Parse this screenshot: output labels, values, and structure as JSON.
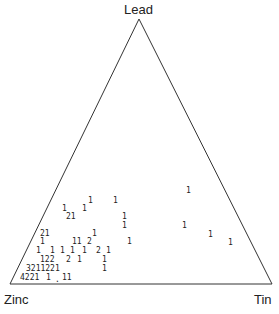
{
  "vertices": {
    "top": "Lead",
    "left": "Zinc",
    "right": "Tin"
  },
  "chart_data": {
    "type": "ternary-count-plot",
    "title": "",
    "axes": [
      "Lead",
      "Zinc",
      "Tin"
    ],
    "points": [
      {
        "x": 186,
        "y": 193,
        "text": "1"
      },
      {
        "x": 88,
        "y": 203,
        "text": "1"
      },
      {
        "x": 113,
        "y": 203,
        "text": "1"
      },
      {
        "x": 62,
        "y": 211,
        "text": "1"
      },
      {
        "x": 82,
        "y": 211,
        "text": "1"
      },
      {
        "x": 66,
        "y": 219,
        "text": "21"
      },
      {
        "x": 122,
        "y": 219,
        "text": "1"
      },
      {
        "x": 122,
        "y": 228,
        "text": "1"
      },
      {
        "x": 182,
        "y": 228,
        "text": "1"
      },
      {
        "x": 208,
        "y": 237,
        "text": "1"
      },
      {
        "x": 40,
        "y": 236,
        "text": "21"
      },
      {
        "x": 92,
        "y": 236,
        "text": "1"
      },
      {
        "x": 40,
        "y": 244,
        "text": "1"
      },
      {
        "x": 72,
        "y": 244,
        "text": "11"
      },
      {
        "x": 87,
        "y": 244,
        "text": "2"
      },
      {
        "x": 127,
        "y": 244,
        "text": "1"
      },
      {
        "x": 228,
        "y": 245,
        "text": "1"
      },
      {
        "x": 36,
        "y": 253,
        "text": "1"
      },
      {
        "x": 50,
        "y": 253,
        "text": "1"
      },
      {
        "x": 60,
        "y": 253,
        "text": "1"
      },
      {
        "x": 70,
        "y": 253,
        "text": "1"
      },
      {
        "x": 82,
        "y": 253,
        "text": "1"
      },
      {
        "x": 96,
        "y": 253,
        "text": "2"
      },
      {
        "x": 106,
        "y": 253,
        "text": "1"
      },
      {
        "x": 40,
        "y": 262,
        "text": "122"
      },
      {
        "x": 66,
        "y": 262,
        "text": "2"
      },
      {
        "x": 77,
        "y": 262,
        "text": "1"
      },
      {
        "x": 102,
        "y": 262,
        "text": "1"
      },
      {
        "x": 26,
        "y": 271,
        "text": "3211221"
      },
      {
        "x": 102,
        "y": 271,
        "text": "1"
      },
      {
        "x": 20,
        "y": 280,
        "text": "4221"
      },
      {
        "x": 46,
        "y": 280,
        "text": "1"
      },
      {
        "x": 55,
        "y": 282,
        "text": "."
      },
      {
        "x": 62,
        "y": 280,
        "text": "11"
      }
    ],
    "triangle": {
      "top": [
        139,
        19
      ],
      "left": [
        10,
        284
      ],
      "right": [
        272,
        284
      ]
    }
  }
}
